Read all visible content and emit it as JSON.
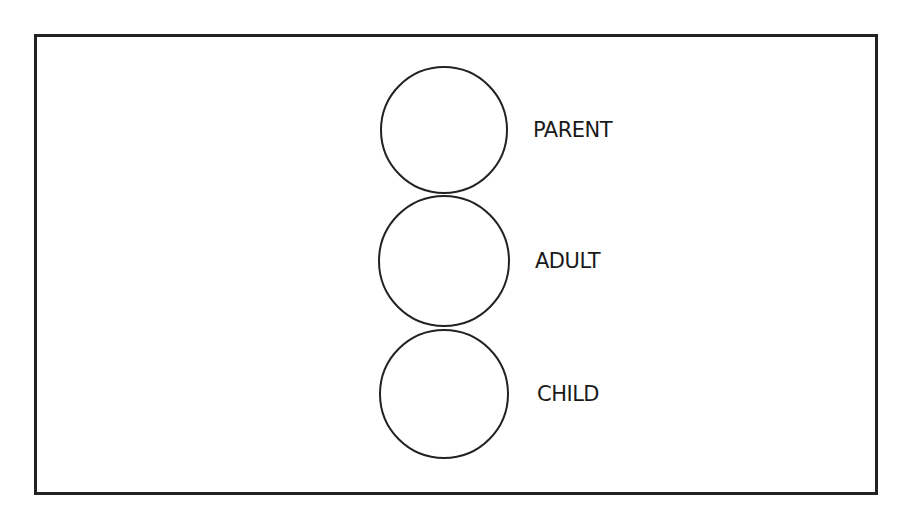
{
  "diagram": {
    "type": "ego-states",
    "states": [
      {
        "label": "PARENT",
        "cx": 444,
        "cy": 130,
        "r": 63,
        "label_x": 533,
        "label_y": 120
      },
      {
        "label": "ADULT",
        "cx": 444,
        "cy": 261,
        "r": 65,
        "label_x": 535,
        "label_y": 251
      },
      {
        "label": "CHILD",
        "cx": 444,
        "cy": 394,
        "r": 64,
        "label_x": 537,
        "label_y": 384
      }
    ],
    "stroke_color": "#222222"
  }
}
